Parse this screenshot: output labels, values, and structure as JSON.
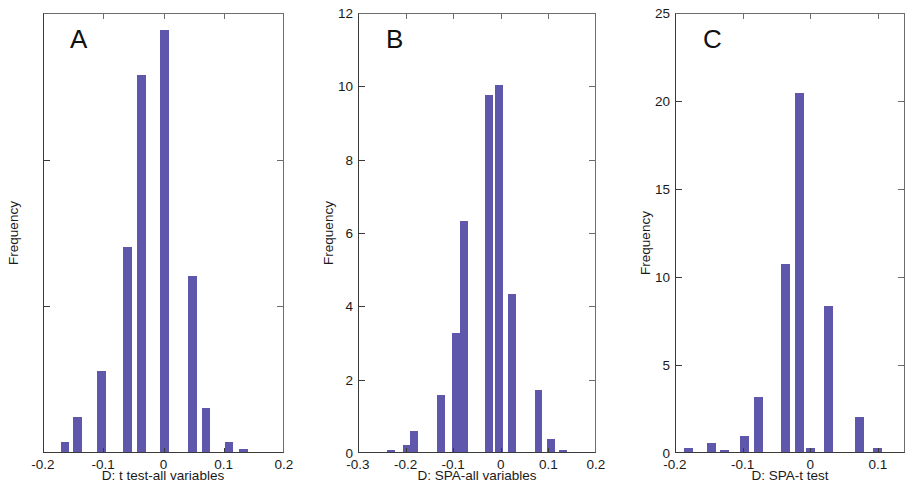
{
  "figure": {
    "background_color": "#ffffff",
    "bar_color": "#5f57ab",
    "axis_color": "#3a3a3a"
  },
  "chart_data": [
    {
      "type": "bar",
      "panel_label": "A",
      "title": "",
      "xlabel": "D: t test-all variables",
      "ylabel": "Frequency",
      "xlim": [
        -0.2,
        0.2
      ],
      "ylim": [
        0,
        15
      ],
      "xticks": [
        "-0.2",
        "-0.1",
        "0",
        "0.1",
        "0.2"
      ],
      "xtick_values": [
        -0.2,
        -0.1,
        0,
        0.1,
        0.2
      ],
      "yticks": [
        "0",
        "5",
        "10",
        "15"
      ],
      "ytick_values": [
        0,
        5,
        10,
        15
      ],
      "grid": false,
      "legend": "none",
      "bin_width": 0.0145,
      "categories": [
        -0.165,
        -0.145,
        -0.105,
        -0.062,
        -0.038,
        0.0,
        0.047,
        0.069,
        0.107,
        0.131
      ],
      "values": [
        0.35,
        1.2,
        2.75,
        7.0,
        12.85,
        14.4,
        6.0,
        1.5,
        0.35,
        0.1
      ]
    },
    {
      "type": "bar",
      "panel_label": "B",
      "title": "",
      "xlabel": "D: SPA-all variables",
      "ylabel": "Frequency",
      "xlim": [
        -0.3,
        0.2
      ],
      "ylim": [
        0,
        12
      ],
      "xticks": [
        "-0.3",
        "-0.2",
        "-0.1",
        "0",
        "0.1",
        "0.2"
      ],
      "xtick_values": [
        -0.3,
        -0.2,
        -0.1,
        0,
        0.1,
        0.2
      ],
      "yticks": [
        "0",
        "2",
        "4",
        "6",
        "8",
        "10",
        "12"
      ],
      "ytick_values": [
        0,
        2,
        4,
        6,
        8,
        10,
        12
      ],
      "grid": false,
      "legend": "none",
      "bin_width": 0.0165,
      "categories": [
        -0.233,
        -0.2,
        -0.184,
        -0.128,
        -0.096,
        -0.079,
        -0.027,
        -0.005,
        0.022,
        0.077,
        0.104,
        0.129
      ],
      "values": [
        0.05,
        0.18,
        0.58,
        1.55,
        3.25,
        6.3,
        9.75,
        10.0,
        4.3,
        1.7,
        0.35,
        0.06
      ]
    },
    {
      "type": "bar",
      "panel_label": "C",
      "title": "",
      "xlabel": "D: SPA-t test",
      "ylabel": "Frequency",
      "xlim": [
        -0.2,
        0.14
      ],
      "ylim": [
        0,
        25
      ],
      "xticks": [
        "-0.2",
        "-0.1",
        "0",
        "0.1"
      ],
      "xtick_values": [
        -0.2,
        -0.1,
        0,
        0.1
      ],
      "yticks": [
        "0",
        "5",
        "10",
        "15",
        "20",
        "25"
      ],
      "ytick_values": [
        0,
        5,
        10,
        15,
        20,
        25
      ],
      "grid": false,
      "legend": "none",
      "bin_width": 0.0135,
      "categories": [
        -0.182,
        -0.148,
        -0.128,
        -0.099,
        -0.078,
        -0.038,
        -0.017,
        -0.001,
        0.026,
        0.071,
        0.098
      ],
      "values": [
        0.25,
        0.5,
        0.1,
        0.9,
        3.1,
        10.7,
        20.4,
        0.25,
        8.3,
        2.0,
        0.25
      ]
    }
  ]
}
